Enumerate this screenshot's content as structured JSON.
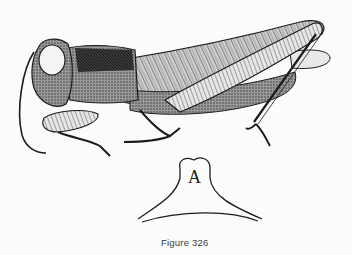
{
  "figure": {
    "caption": "Figure 326",
    "detail_label": "A",
    "detail_subject": "pronotum outline detail"
  },
  "colors": {
    "ink": "#1c1c1c",
    "paper": "#fbfbf9",
    "caption_text": "#3a3a3a"
  }
}
